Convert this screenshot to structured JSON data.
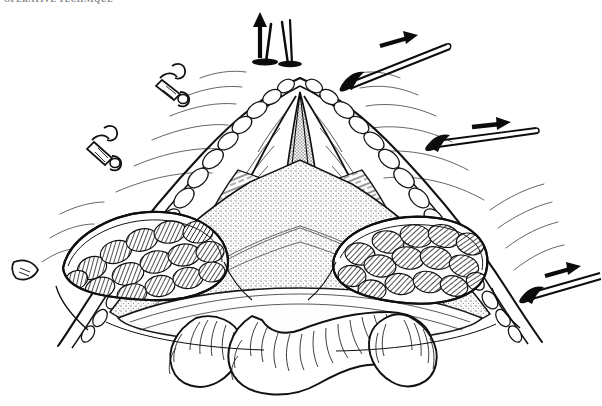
{
  "figure": {
    "caption_top": "OPERATIVE TECHNIQUE",
    "background_color": "#ffffff",
    "ink_color": "#111111",
    "style": "pen-and-ink line engraving",
    "width": 602,
    "height": 406
  },
  "instruments": {
    "top_retractor": {
      "name": "vertical retractor",
      "arrow_direction": "up",
      "position": "top-center"
    },
    "right_retractor_upper": {
      "name": "hand-held retractor",
      "arrow_direction": "right",
      "position": "top-right"
    },
    "right_retractor_middle": {
      "name": "hand-held retractor",
      "arrow_direction": "right",
      "position": "mid-right"
    },
    "right_retractor_lower": {
      "name": "hand-held retractor",
      "arrow_direction": "right",
      "position": "lower-right"
    },
    "clamp_upper_left": {
      "name": "hemostat clamp",
      "position": "upper-left"
    },
    "clamp_lower_left": {
      "name": "hemostat clamp",
      "position": "mid-left"
    },
    "probe_left": {
      "name": "pointed probe tip",
      "position": "left-edge"
    }
  },
  "anatomy": {
    "midline_incision": "central vertical incision apex",
    "skin_edge": "everted skin and subcutaneous margin",
    "fascia": "stippled fascial sheet",
    "left_lobe": "lobulated glandular / muscular mass (left)",
    "right_lobe": "lobulated glandular / muscular mass (right)",
    "bowel_loops": "three rounded serosal loops with hatched striations",
    "tissue_planes": "retracted flap layers with parallel hatching"
  }
}
